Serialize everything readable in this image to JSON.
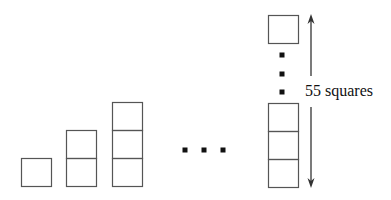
{
  "diagram": {
    "colors": {
      "stroke": "#555555",
      "dot": "#111111",
      "arrow": "#333333",
      "background": "#ffffff"
    },
    "square": {
      "width": 30,
      "height": 28
    },
    "stacks": [
      {
        "id": "stack-1",
        "count": 1,
        "x": 21,
        "bottom": 186
      },
      {
        "id": "stack-2",
        "count": 2,
        "x": 66,
        "bottom": 186
      },
      {
        "id": "stack-3",
        "count": 3,
        "x": 112,
        "bottom": 186
      }
    ],
    "horizontal_ellipsis": {
      "y": 150,
      "xs": [
        185,
        204,
        223
      ],
      "size": 5
    },
    "final_stack": {
      "id": "stack-55",
      "x": 268,
      "bottom_squares": 3,
      "bottom": 187,
      "top_square_y": 15,
      "vertical_ellipsis": {
        "x": 282,
        "ys": [
          55,
          74,
          92
        ],
        "size": 5
      }
    },
    "arrow": {
      "x": 311,
      "top": 14,
      "bottom": 188,
      "gap_top": 76,
      "gap_bottom": 107
    },
    "label": {
      "text": "55 squares",
      "x": 304,
      "y": 83
    }
  }
}
